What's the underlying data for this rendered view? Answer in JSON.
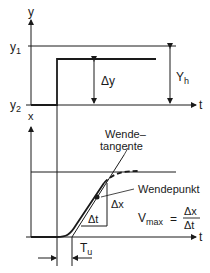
{
  "top_plot": {
    "y_axis_label": "y",
    "y1_label": "y",
    "y1_sub": "1",
    "y2_label": "y",
    "y2_sub": "2",
    "t_label": "t",
    "delta_y_label": "Δy",
    "yh_label": "Y",
    "yh_sub": "h"
  },
  "bottom_plot": {
    "x_axis_label": "x",
    "t_label": "t",
    "tangent_label_line1": "Wende–",
    "tangent_label_line2": "tangente",
    "inflection_label": "Wendepunkt",
    "delta_x_label": "Δx",
    "delta_t_label": "Δt",
    "vmax_label": "V",
    "vmax_sub": "max",
    "vmax_eq": "=",
    "vmax_num": "Δx",
    "vmax_den": "Δt",
    "tu_label": "T",
    "tu_sub": "u"
  }
}
